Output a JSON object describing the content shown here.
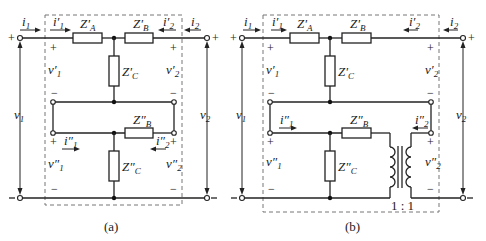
{
  "figure": {
    "panels": [
      {
        "caption": "(a)",
        "labels": {
          "i1": "i",
          "i1_sub": "1",
          "i1p": "i′",
          "i1p_sub": "1",
          "i2": "i",
          "i2_sub": "2",
          "i2p": "i′",
          "i2p_sub": "2",
          "ZAp": "Z′",
          "ZAp_sub": "A",
          "ZBp": "Z′",
          "ZBp_sub": "B",
          "ZCp": "Z′",
          "ZCp_sub": "C",
          "ZBpp": "Z″",
          "ZBpp_sub": "B",
          "ZCpp": "Z″",
          "ZCpp_sub": "C",
          "v1": "v",
          "v1_sub": "1",
          "v2": "v",
          "v2_sub": "2",
          "v1p": "v′",
          "v1p_sub": "1",
          "v2p": "v′",
          "v2p_sub": "2",
          "v1pp": "v″",
          "v1pp_sub": "1",
          "v2pp": "v″",
          "v2pp_sub": "2",
          "i1pp": "i″",
          "i1pp_sub": "1",
          "i2pp": "i″",
          "i2pp_sub": "2"
        }
      },
      {
        "caption": "(b)",
        "ratio": "1 : 1"
      }
    ],
    "signs": {
      "plus": "+",
      "minus": "−"
    }
  }
}
